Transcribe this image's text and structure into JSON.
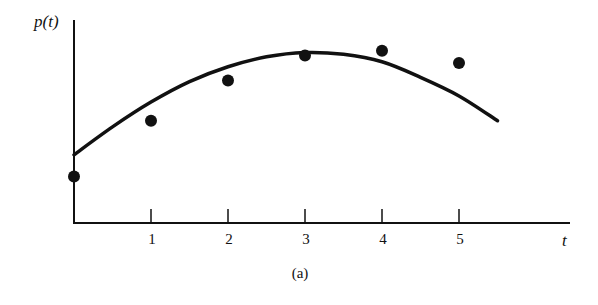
{
  "chart_data": {
    "type": "scatter",
    "title": "",
    "caption": "(a)",
    "xlabel": "t",
    "ylabel": "p(t)",
    "x_ticks": [
      "1",
      "2",
      "3",
      "4",
      "5"
    ],
    "xlim": [
      0,
      5.6
    ],
    "ylim": [
      0,
      3.4
    ],
    "grid": false,
    "legend": null,
    "series": [
      {
        "name": "data points",
        "kind": "scatter",
        "x": [
          0,
          1,
          2,
          3,
          4,
          5
        ],
        "y": [
          0.75,
          1.65,
          2.3,
          2.7,
          2.78,
          2.58
        ]
      },
      {
        "name": "fitted curve",
        "kind": "line",
        "x": [
          0,
          0.5,
          1,
          1.5,
          2,
          2.5,
          3,
          3.5,
          4,
          4.5,
          5,
          5.5
        ],
        "y": [
          1.1,
          1.55,
          1.95,
          2.28,
          2.52,
          2.68,
          2.75,
          2.72,
          2.6,
          2.35,
          2.05,
          1.65
        ]
      }
    ]
  },
  "labels": {
    "ylabel": "p(t)",
    "xlabel": "t",
    "caption": "(a)",
    "ticks": [
      "1",
      "2",
      "3",
      "4",
      "5"
    ]
  }
}
